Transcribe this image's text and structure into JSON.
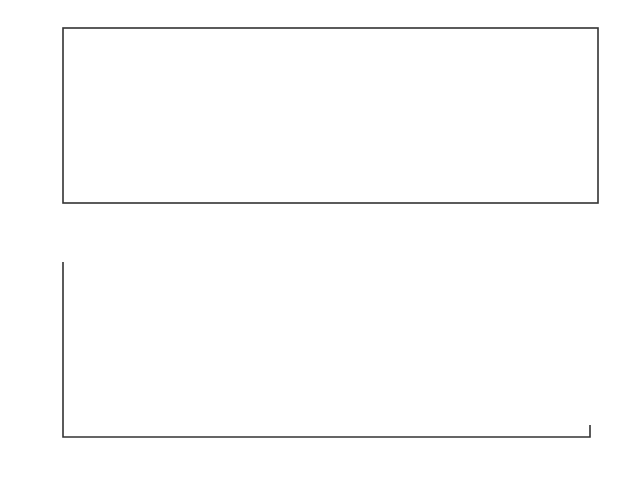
{
  "chart_data": [
    {
      "type": "line",
      "title": "",
      "xlabel": "",
      "ylabel": "",
      "xlim": [
        0,
        400
      ],
      "ylim": [
        -3,
        3
      ],
      "grid": false,
      "legend": null,
      "x_ticks": [
        "0",
        "50",
        "100",
        "150",
        "200",
        "250",
        "300",
        "350",
        "400"
      ],
      "y_ticks": [
        "3",
        "2",
        "1",
        "0",
        "−1",
        "−2",
        "−3"
      ],
      "description": "Many overlapping sinusoidal-like trajectories (dense bundle of curves) wrapping between -3 and 3; bands of convergence near y≈1 and y≈-0.8",
      "series_count_approx": 40
    },
    {
      "type": "scatter",
      "title": "",
      "xlabel": "",
      "ylabel": "",
      "xlim": [
        0,
        200
      ],
      "ylim": [
        -3,
        3
      ],
      "grid": false,
      "legend": null,
      "x_ticks": [
        "0",
        "20",
        "40",
        "60",
        "80",
        "100",
        "120",
        "140",
        "160",
        "180",
        "200"
      ],
      "y_ticks": [
        "3",
        "2",
        "1",
        "0",
        "−1",
        "−2",
        "−3"
      ],
      "points": [
        [
          2,
          2.95
        ],
        [
          6,
          2.8
        ],
        [
          10,
          2.4
        ],
        [
          14,
          1.9
        ],
        [
          16,
          1.6
        ],
        [
          18,
          1.45
        ],
        [
          12,
          0.7
        ],
        [
          8,
          -0.9
        ],
        [
          1,
          -2.98
        ],
        [
          3,
          -2.98
        ],
        [
          5,
          -2.85
        ],
        [
          7,
          -2.7
        ],
        [
          9,
          -2.5
        ],
        [
          11,
          -2.35
        ],
        [
          13,
          -2.05
        ],
        [
          15,
          -1.75
        ],
        [
          17,
          -1.45
        ],
        [
          19,
          -0.75
        ],
        [
          20,
          -1.55
        ],
        [
          21,
          -1.0
        ],
        [
          22,
          -0.05
        ],
        [
          23,
          -1.4
        ],
        [
          24,
          -1.0
        ],
        [
          25,
          -0.9
        ],
        [
          26,
          -0.4
        ],
        [
          27,
          -0.05
        ],
        [
          28,
          -1.05
        ],
        [
          29,
          -0.05
        ],
        [
          30,
          -1.0
        ],
        [
          31,
          -1.55
        ],
        [
          32,
          -0.7
        ],
        [
          33,
          1.45
        ],
        [
          35,
          1.7
        ],
        [
          34,
          -0.35
        ],
        [
          36,
          -0.5
        ],
        [
          37,
          0.65
        ],
        [
          38,
          0.75
        ],
        [
          39,
          -0.75
        ],
        [
          40,
          -0.8
        ],
        [
          41,
          2.4
        ],
        [
          43,
          2.6
        ],
        [
          42,
          -2.5
        ],
        [
          44,
          -0.9
        ],
        [
          45,
          0.95
        ],
        [
          46,
          0.97
        ],
        [
          49,
          1.0
        ],
        [
          54,
          0.98
        ],
        [
          57,
          0.9
        ],
        [
          52,
          -0.97
        ],
        [
          55,
          -0.95
        ],
        [
          47,
          -2.92
        ],
        [
          48,
          -2.95
        ],
        [
          50,
          -2.95
        ],
        [
          51,
          -2.95
        ],
        [
          53,
          -2.93
        ],
        [
          56,
          -2.7
        ],
        [
          58,
          -2.6
        ],
        [
          59,
          -2.5
        ],
        [
          60,
          -0.75
        ],
        [
          61,
          2.3
        ],
        [
          62,
          -0.6
        ],
        [
          63,
          2.05
        ],
        [
          64,
          -0.58
        ],
        [
          65,
          0.6
        ],
        [
          66,
          -0.58
        ],
        [
          67,
          -0.55
        ],
        [
          68,
          -0.25
        ],
        [
          69,
          1.05
        ],
        [
          70,
          -1.08
        ],
        [
          71,
          0.25
        ],
        [
          72,
          -0.15
        ],
        [
          73,
          0.15
        ],
        [
          74,
          -0.45
        ],
        [
          75,
          -0.9
        ],
        [
          76,
          -0.35
        ],
        [
          77,
          -0.65
        ],
        [
          78,
          -1.4
        ],
        [
          79,
          -0.75
        ],
        [
          80,
          0.3
        ],
        [
          81,
          -1.2
        ],
        [
          82,
          -0.7
        ],
        [
          83,
          -0.6
        ],
        [
          84,
          0.5
        ],
        [
          85,
          1.85
        ],
        [
          86,
          0.8
        ],
        [
          87,
          -1.95
        ],
        [
          88,
          0.7
        ],
        [
          89,
          -2.25
        ],
        [
          90,
          -2.4
        ],
        [
          91,
          -2.6
        ],
        [
          92,
          -0.85
        ],
        [
          93,
          2.7
        ],
        [
          94,
          2.8
        ],
        [
          95,
          2.9
        ],
        [
          96,
          -0.9
        ],
        [
          97,
          2.95
        ],
        [
          98,
          -0.95
        ],
        [
          99,
          2.9
        ],
        [
          100,
          1.0
        ],
        [
          100.5,
          -2.95
        ],
        [
          101,
          2.9
        ],
        [
          102,
          -0.95
        ],
        [
          103,
          0.95
        ],
        [
          104,
          -0.95
        ],
        [
          105,
          -2.9
        ],
        [
          106,
          -0.85
        ],
        [
          107,
          2.5
        ],
        [
          108,
          0.7
        ],
        [
          109,
          -2.4
        ],
        [
          110,
          0.6
        ],
        [
          111,
          -2.2
        ],
        [
          112,
          -2.0
        ],
        [
          113,
          -1.85
        ],
        [
          114,
          -0.7
        ],
        [
          115,
          1.45
        ],
        [
          116,
          -1.4
        ],
        [
          117,
          -0.55
        ],
        [
          118,
          -0.3
        ],
        [
          119,
          0.1
        ],
        [
          120,
          -1.15
        ],
        [
          121,
          -0.4
        ],
        [
          122,
          0.3
        ],
        [
          123,
          0.95
        ],
        [
          124,
          -0.1
        ],
        [
          125,
          -0.45
        ],
        [
          126,
          -0.2
        ],
        [
          127,
          0.4
        ],
        [
          128,
          -0.5
        ],
        [
          129,
          1.3
        ],
        [
          130,
          -0.5
        ],
        [
          131,
          -1.25
        ],
        [
          132,
          0.6
        ],
        [
          133,
          -1.65
        ],
        [
          134,
          0.75
        ],
        [
          135,
          -1.9
        ],
        [
          136,
          -2.1
        ],
        [
          138,
          -0.75
        ],
        [
          139,
          2.4
        ],
        [
          140,
          2.55
        ],
        [
          141,
          -0.75
        ],
        [
          142,
          0.9
        ],
        [
          143,
          0.95
        ],
        [
          145,
          -0.9
        ],
        [
          146,
          1.0
        ],
        [
          147,
          -0.95
        ],
        [
          148,
          -0.95
        ],
        [
          149,
          -0.95
        ],
        [
          150,
          1.0
        ],
        [
          151,
          2.95
        ],
        [
          152,
          1.0
        ],
        [
          153,
          1.0
        ],
        [
          154,
          -0.9
        ],
        [
          155,
          -0.85
        ],
        [
          156,
          -0.8
        ],
        [
          157,
          -0.75
        ],
        [
          158,
          2.4
        ],
        [
          159,
          -2.2
        ],
        [
          160,
          0.75
        ],
        [
          161,
          -2.0
        ],
        [
          162,
          0.65
        ],
        [
          163,
          -1.85
        ],
        [
          164,
          -1.7
        ],
        [
          165,
          -1.35
        ],
        [
          166,
          1.4
        ],
        [
          167,
          -0.4
        ],
        [
          168,
          -0.6
        ],
        [
          169,
          -0.55
        ],
        [
          170,
          0.85
        ],
        [
          171,
          -0.1
        ],
        [
          172,
          0.0
        ],
        [
          173,
          0.35
        ],
        [
          174,
          0.6
        ],
        [
          175,
          0.7
        ],
        [
          176,
          -0.45
        ],
        [
          177,
          0.72
        ],
        [
          178,
          0.75
        ],
        [
          179,
          -1.15
        ],
        [
          180,
          -1.6
        ],
        [
          181,
          1.4
        ],
        [
          182,
          0.75
        ],
        [
          183,
          -0.5
        ]
      ]
    }
  ]
}
